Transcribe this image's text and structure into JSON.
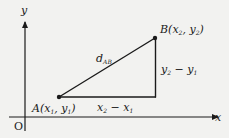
{
  "diagram": {
    "title": "",
    "axes": {
      "x_label": "x",
      "y_label": "y",
      "origin_label": "O"
    },
    "points": {
      "A": {
        "name": "A",
        "label": "A(x₁, y₁)",
        "coords": "x₁, y₁"
      },
      "B": {
        "name": "B",
        "label": "B(x₂, y₂)",
        "coords": "x₂, y₂"
      }
    },
    "segments": {
      "hypotenuse": "d_AB",
      "hypotenuse_main": "d",
      "hypotenuse_sub": "AB",
      "horizontal": "x₂ − x₁",
      "vertical": "y₂ − y₁"
    },
    "colors": {
      "background": "#f2f2f0",
      "ink": "#1a1a1a"
    }
  }
}
